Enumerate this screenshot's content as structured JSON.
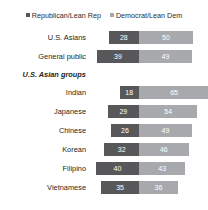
{
  "legend": {
    "items": [
      {
        "label": "Republican/Lean Rep",
        "color": "#58585b",
        "key": "republican"
      },
      {
        "label": "Democrat/Lean Dem",
        "color": "#a7a9ac",
        "key": "democrat"
      }
    ]
  },
  "subhead": {
    "label": "U.S. Asian groups"
  },
  "chart_data": {
    "type": "bar",
    "title": "",
    "subtitle": "",
    "xlabel": "",
    "ylabel": "",
    "orientation": "horizontal",
    "stacked": true,
    "grid": false,
    "legend_position": "top-center",
    "unit": "%",
    "categories": [
      "U.S. Asians",
      "General public",
      "Indian",
      "Japanese",
      "Chinese",
      "Korean",
      "Filipino",
      "Vietnamese"
    ],
    "series": [
      {
        "name": "Republican/Lean Rep",
        "color": "#58585b",
        "values": [
          28,
          39,
          18,
          29,
          26,
          32,
          40,
          35
        ]
      },
      {
        "name": "Democrat/Lean Dem",
        "color": "#a7a9ac",
        "values": [
          50,
          49,
          65,
          54,
          49,
          46,
          43,
          36
        ]
      }
    ],
    "groups": [
      {
        "name": "",
        "rows": [
          {
            "label": "U.S. Asians",
            "republican": 28,
            "democrat": 50
          },
          {
            "label": "General public",
            "republican": 39,
            "democrat": 49
          }
        ]
      },
      {
        "name": "U.S. Asian groups",
        "rows": [
          {
            "label": "Indian",
            "republican": 18,
            "democrat": 65
          },
          {
            "label": "Japanese",
            "republican": 29,
            "democrat": 54
          },
          {
            "label": "Chinese",
            "republican": 26,
            "democrat": 49
          },
          {
            "label": "Korean",
            "republican": 32,
            "democrat": 46
          },
          {
            "label": "Filipino",
            "republican": 40,
            "democrat": 43
          },
          {
            "label": "Vietnamese",
            "republican": 35,
            "democrat": 36
          }
        ]
      }
    ]
  }
}
